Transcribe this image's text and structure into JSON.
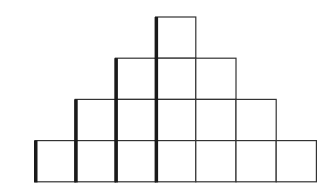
{
  "diagram": {
    "type": "square-pyramid-staircase",
    "rows": [
      {
        "row": 1,
        "count": 1,
        "start_col": 3
      },
      {
        "row": 2,
        "count": 3,
        "start_col": 2
      },
      {
        "row": 3,
        "count": 5,
        "start_col": 1
      },
      {
        "row": 4,
        "count": 7,
        "start_col": 0
      }
    ],
    "thick_edges_columns": [
      0,
      1,
      2,
      3
    ],
    "total_squares": 16,
    "colors": {
      "stroke": "#333333",
      "thick_stroke": "#1a1a1a",
      "fill": "#ffffff"
    }
  }
}
